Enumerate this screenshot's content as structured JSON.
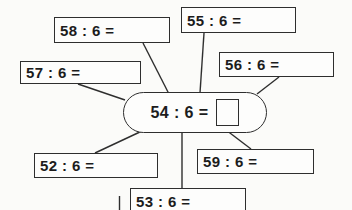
{
  "colors": {
    "background": "#fbfbf9",
    "ink": "#2e2e2e"
  },
  "worksheet": {
    "center": {
      "label": "54 : 6 ="
    },
    "problems": [
      {
        "label": "58 : 6 ="
      },
      {
        "label": "55 : 6 ="
      },
      {
        "label": "57 : 6 ="
      },
      {
        "label": "56 : 6 ="
      },
      {
        "label": "52 : 6 ="
      },
      {
        "label": "59 : 6 ="
      },
      {
        "label": "53 : 6 ="
      }
    ]
  }
}
